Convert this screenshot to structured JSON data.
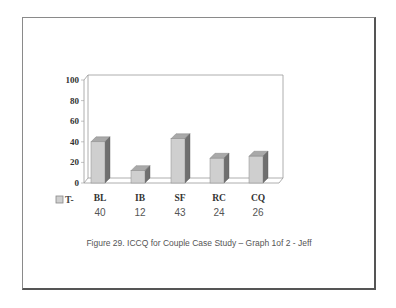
{
  "chart_data": {
    "type": "bar",
    "style": "3d-column",
    "categories": [
      "BL",
      "IB",
      "SF",
      "RC",
      "CQ"
    ],
    "series": [
      {
        "name": "T-",
        "values": [
          40,
          12,
          43,
          24,
          26
        ]
      }
    ],
    "title": "",
    "xlabel": "",
    "ylabel": "",
    "ylim": [
      0,
      100
    ],
    "yticks": [
      0,
      20,
      40,
      60,
      80,
      100
    ],
    "grid": false,
    "legend_position": "bottom-left",
    "data_table_row": [
      "40",
      "12",
      "43",
      "24",
      "26"
    ]
  },
  "legend": {
    "label": "T-"
  },
  "yticks": [
    "0",
    "20",
    "40",
    "60",
    "80",
    "100"
  ],
  "categories": [
    "BL",
    "IB",
    "SF",
    "RC",
    "CQ"
  ],
  "values_text": [
    "40",
    "12",
    "43",
    "24",
    "26"
  ],
  "caption": "Figure 29. ICCQ for Couple Case Study – Graph 1of 2 - Jeff",
  "colors": {
    "bar_front": "#cfcfcf",
    "bar_top": "#a9a9a9",
    "bar_side": "#6f6f6f",
    "axis": "#9a9a9a",
    "frame": "#666666"
  }
}
